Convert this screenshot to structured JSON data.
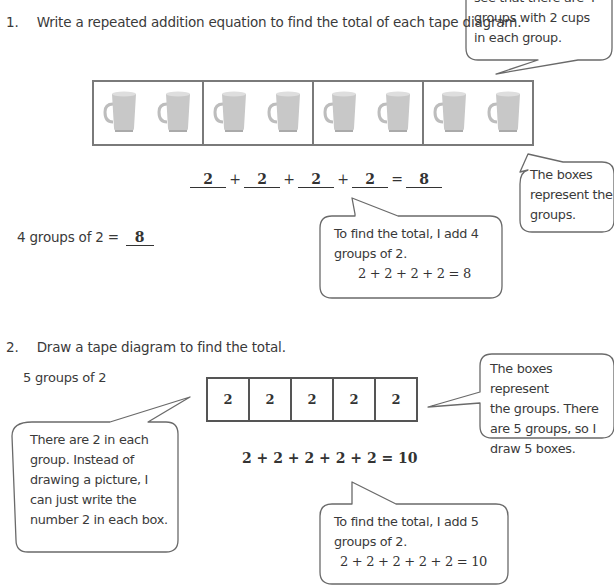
{
  "problem1": {
    "number": "1.",
    "instruction": "Write a repeated addition equation to find the total of each tape diagram.",
    "tape": {
      "groups": 4,
      "items_per_group": 2,
      "item_icon": "mug-icon",
      "segments": [
        {
          "items": [
            "mug",
            "mug"
          ]
        },
        {
          "items": [
            "mug",
            "mug"
          ]
        },
        {
          "items": [
            "mug",
            "mug"
          ]
        },
        {
          "items": [
            "mug",
            "mug"
          ]
        }
      ]
    },
    "equation": {
      "addends": [
        "2",
        "2",
        "2",
        "2"
      ],
      "plus": "+",
      "equals": "=",
      "total": "8"
    },
    "groups_statement": {
      "label": "4 groups of 2 =",
      "answer": "8"
    },
    "callouts": {
      "top_right": {
        "line1": "see that there are 4",
        "line2": "groups with 2 cups",
        "line3": "in each group."
      },
      "boxes": {
        "line1": "The boxes",
        "line2": "represent the",
        "line3": "groups."
      },
      "total": {
        "line1": "To find the total, I add 4",
        "line2": "groups of 2.",
        "equation": "2 + 2 + 2 + 2 = 8"
      }
    }
  },
  "problem2": {
    "number": "2.",
    "instruction": "Draw a tape diagram to find the total.",
    "prompt": "5 groups of 2",
    "tape": {
      "segments": [
        "2",
        "2",
        "2",
        "2",
        "2"
      ]
    },
    "equation": "2 + 2 + 2 + 2 + 2 = 10",
    "callouts": {
      "boxes": {
        "line1": "The boxes represent",
        "line2": "the groups.  There",
        "line3": "are 5 groups, so I",
        "line4": "draw 5 boxes."
      },
      "each": {
        "line1": "There are 2 in each",
        "line2": "group.  Instead of",
        "line3": "drawing a picture, I",
        "line4": "can just write the",
        "line5": "number 2 in each box."
      },
      "total": {
        "line1": "To find the total, I add 5",
        "line2": "groups of 2.",
        "equation": "2 + 2 +  2 + 2 + 2 = 10"
      }
    }
  }
}
